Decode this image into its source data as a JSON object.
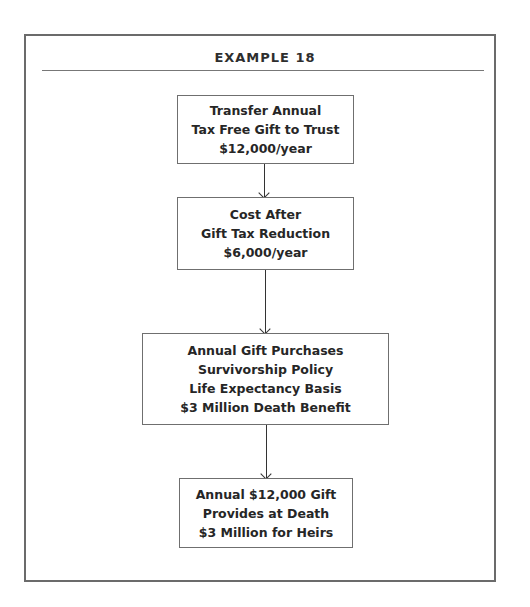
{
  "diagram": {
    "title": "EXAMPLE 18",
    "steps": [
      {
        "lines": [
          "Transfer Annual",
          "Tax Free Gift to Trust",
          "$12,000/year"
        ]
      },
      {
        "lines": [
          "Cost After",
          "Gift Tax Reduction",
          "$6,000/year"
        ]
      },
      {
        "lines": [
          "Annual Gift Purchases",
          "Survivorship Policy",
          "Life Expectancy Basis",
          "$3 Million Death Benefit"
        ]
      },
      {
        "lines": [
          "Annual $12,000 Gift",
          "Provides at Death",
          "$3 Million for Heirs"
        ]
      }
    ],
    "colors": {
      "frame": "#6b6b6b",
      "text": "#262626",
      "arrow": "#333333"
    }
  }
}
